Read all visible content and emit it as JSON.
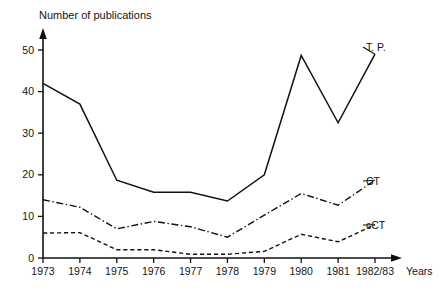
{
  "chart_data": {
    "type": "line",
    "title": "Number of publications",
    "xlabel": "Years",
    "ylabel": "",
    "categories": [
      "1973",
      "1974",
      "1975",
      "1976",
      "1977",
      "1978",
      "1979",
      "1980",
      "1981",
      "1982/83"
    ],
    "xlim": [
      0,
      9
    ],
    "ylim": [
      0,
      52
    ],
    "yticks": [
      0,
      10,
      20,
      30,
      40,
      50
    ],
    "ytick_labels": [
      "0",
      "10",
      "20",
      "30",
      "40",
      "50"
    ],
    "grid": false,
    "legend_position": "inline-right-of-line-ends",
    "series": [
      {
        "name": "T. P.",
        "style": "solid",
        "values": [
          42,
          37,
          18.7,
          15.8,
          15.8,
          13.7,
          20,
          48.7,
          32.5,
          49
        ]
      },
      {
        "name": "CT",
        "style": "dash-dot",
        "values": [
          14,
          12.2,
          7,
          8.8,
          7.5,
          5,
          10.3,
          15.5,
          12.7,
          18.7
        ]
      },
      {
        "name": "cCT",
        "style": "dashed",
        "values": [
          6,
          6.1,
          2,
          2,
          0.9,
          0.9,
          1.6,
          5.7,
          3.9,
          8
        ]
      }
    ]
  },
  "labels": {
    "plot_title": "Number of publications",
    "x_axis_title": "Years",
    "series_tp": "T. P.",
    "series_ct": "CT",
    "series_cct": "cCT"
  },
  "colors": {
    "ink": "#111111",
    "background": "#ffffff"
  }
}
